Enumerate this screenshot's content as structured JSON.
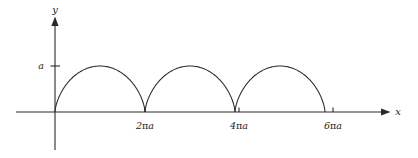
{
  "figure": {
    "background_color": "#ffffff",
    "line_color": "#2a2a2a",
    "text_color": "#1c1c1c",
    "width": 418,
    "height": 158
  },
  "axes": {
    "x_axis_label": "x",
    "y_axis_label": "y",
    "x_axis_y_pixel": 112,
    "y_axis_x_pixel": 55,
    "x_axis_start": 16,
    "x_axis_end": 385,
    "y_axis_top": 22,
    "y_axis_bottom": 150
  },
  "y_ticks": [
    {
      "label": "a",
      "value": 1,
      "y_pixel": 66
    }
  ],
  "x_ticks": [
    {
      "label": "2πa",
      "lead": "2",
      "pi": "π",
      "trail": "a",
      "x_pixel": 145
    },
    {
      "label": "4πa",
      "lead": "4",
      "pi": "π",
      "trail": "a",
      "x_pixel": 239
    },
    {
      "label": "6πa",
      "lead": "6",
      "pi": "π",
      "trail": "a",
      "x_pixel": 333
    }
  ],
  "chart_data": {
    "type": "line",
    "title": "",
    "subtitle": "",
    "xlabel": "x",
    "ylabel": "y",
    "curve_name": "cycloid",
    "parametric": {
      "x": "a(t - sin t)",
      "y": "a(1 - cos t)",
      "t_range": [
        0,
        18.8496
      ],
      "arch_count": 3
    },
    "xlim": [
      0,
      21.99
    ],
    "ylim": [
      0,
      2
    ],
    "xtick_values": [
      6.2832,
      12.5664,
      18.8496
    ],
    "xtick_labels": [
      "2πa",
      "4πa",
      "6πa"
    ],
    "ytick_values": [
      1
    ],
    "ytick_labels": [
      "a"
    ],
    "grid": false,
    "legend": false,
    "annotations": [],
    "series": [
      {
        "name": "cycloid",
        "color": "#2a2a2a",
        "arches": [
          {
            "cusp_start": 0,
            "cusp_end": 6.2832,
            "peak_x": 3.1416,
            "peak_y": 1
          },
          {
            "cusp_start": 6.2832,
            "cusp_end": 12.5664,
            "peak_x": 9.4248,
            "peak_y": 1
          },
          {
            "cusp_start": 12.5664,
            "cusp_end": 18.8496,
            "peak_x": 15.708,
            "peak_y": 1
          }
        ]
      }
    ]
  }
}
